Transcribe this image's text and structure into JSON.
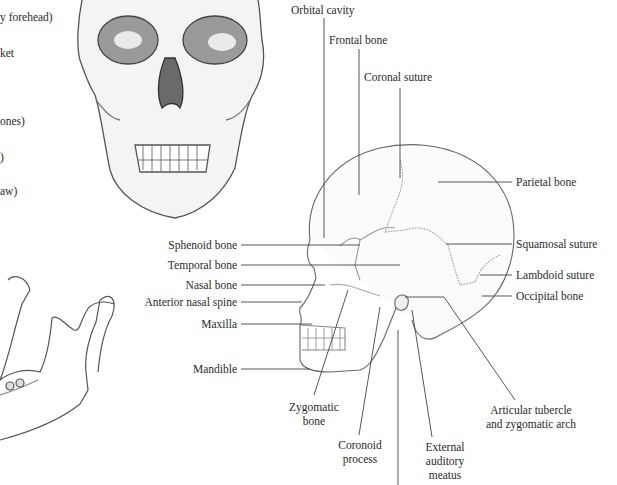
{
  "left_partial_labels": [
    "y forehead)",
    "ket",
    "ones)",
    ")",
    "aw)"
  ],
  "lateral_view": {
    "top_labels": {
      "orbital_cavity": "Orbital cavity",
      "frontal_bone": "Frontal bone",
      "coronal_suture": "Coronal suture"
    },
    "left_labels": {
      "sphenoid_bone": "Sphenoid bone",
      "temporal_bone": "Temporal bone",
      "nasal_bone": "Nasal bone",
      "anterior_nasal_spine": "Anterior nasal spine",
      "maxilla": "Maxilla",
      "mandible": "Mandible"
    },
    "right_labels": {
      "parietal_bone": "Parietal bone",
      "squamosal_suture": "Squamosal suture",
      "lambdoid_suture": "Lambdoid suture",
      "occipital_bone": "Occipital bone"
    },
    "bottom_labels": {
      "zygomatic_bone": [
        "Zygomatic",
        "bone"
      ],
      "coronoid_process": [
        "Coronoid",
        "process"
      ],
      "external_auditory_meatus": [
        "External",
        "auditory",
        "meatus"
      ],
      "articular_tubercle": [
        "Articular tubercle",
        "and zygomatic arch"
      ]
    }
  },
  "colors": {
    "background": "#ffffff",
    "text": "#2a2a2a",
    "leader_line": "#444444",
    "sketch": "#555555"
  }
}
